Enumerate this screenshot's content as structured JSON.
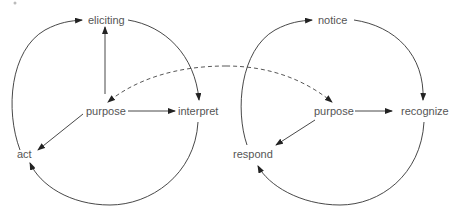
{
  "diagram": {
    "left_cycle": {
      "nodes": {
        "top": "eliciting",
        "center": "purpose",
        "right": "interpret",
        "left": "act"
      }
    },
    "right_cycle": {
      "nodes": {
        "top": "notice",
        "center": "purpose",
        "right": "recognize",
        "left": "respond"
      }
    },
    "connector": {
      "style": "dashed",
      "description": "links left purpose and right purpose"
    },
    "colors": {
      "line": "#333333",
      "text": "#555555"
    }
  }
}
